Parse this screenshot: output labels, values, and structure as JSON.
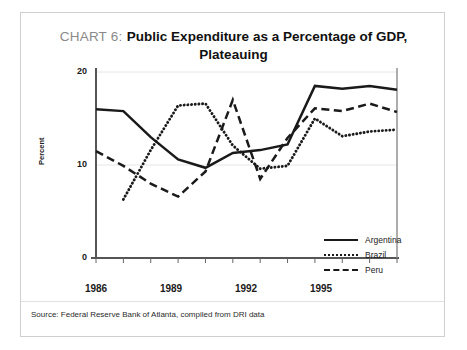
{
  "figure": {
    "title_prefix": "CHART 6:",
    "title_main": "Public Expenditure as a Percentage of GDP, Plateauing",
    "source": "Source: Federal Reserve Bank of Atlanta, compiled from DRI data",
    "border_color": "#cfcfcf",
    "ink_color": "#1a1a1a"
  },
  "chart_data": {
    "type": "line",
    "title": "CHART 6: Public Expenditure as a Percentage of GDP, Plateauing",
    "xlabel": "",
    "ylabel": "Percent",
    "xlim": [
      1986,
      1997
    ],
    "ylim": [
      0,
      20
    ],
    "yticks": [
      0,
      10,
      20
    ],
    "ytick_labels": [
      "0",
      "10",
      "20"
    ],
    "xticks": [
      1986,
      1989,
      1992,
      1995
    ],
    "xtick_labels": [
      "1986",
      "1989",
      "1992",
      "1995"
    ],
    "x": [
      1986,
      1987,
      1988,
      1989,
      1990,
      1991,
      1992,
      1993,
      1994,
      1995,
      1996,
      1997
    ],
    "grid": "horizontal-faint",
    "legend_position": "lower-right-inside",
    "series": [
      {
        "name": "Argentina",
        "style": "solid",
        "color": "#1a1a1a",
        "values": [
          16.0,
          15.8,
          13.0,
          10.6,
          9.7,
          11.3,
          11.6,
          12.2,
          18.5,
          18.2,
          18.5,
          18.1
        ]
      },
      {
        "name": "Brazil",
        "style": "dotted",
        "color": "#1a1a1a",
        "values": [
          null,
          6.3,
          11.6,
          16.4,
          16.6,
          12.1,
          9.6,
          9.9,
          15.0,
          13.1,
          13.6,
          13.8
        ]
      },
      {
        "name": "Peru",
        "style": "dashed",
        "color": "#1a1a1a",
        "values": [
          11.5,
          9.9,
          8.0,
          6.6,
          9.3,
          17.0,
          8.5,
          12.9,
          16.1,
          15.8,
          16.6,
          15.7
        ]
      }
    ]
  },
  "legend": {
    "items": [
      {
        "label": "Argentina",
        "style": "solid"
      },
      {
        "label": "Brazil",
        "style": "dotted"
      },
      {
        "label": "Peru",
        "style": "dashed"
      }
    ]
  }
}
